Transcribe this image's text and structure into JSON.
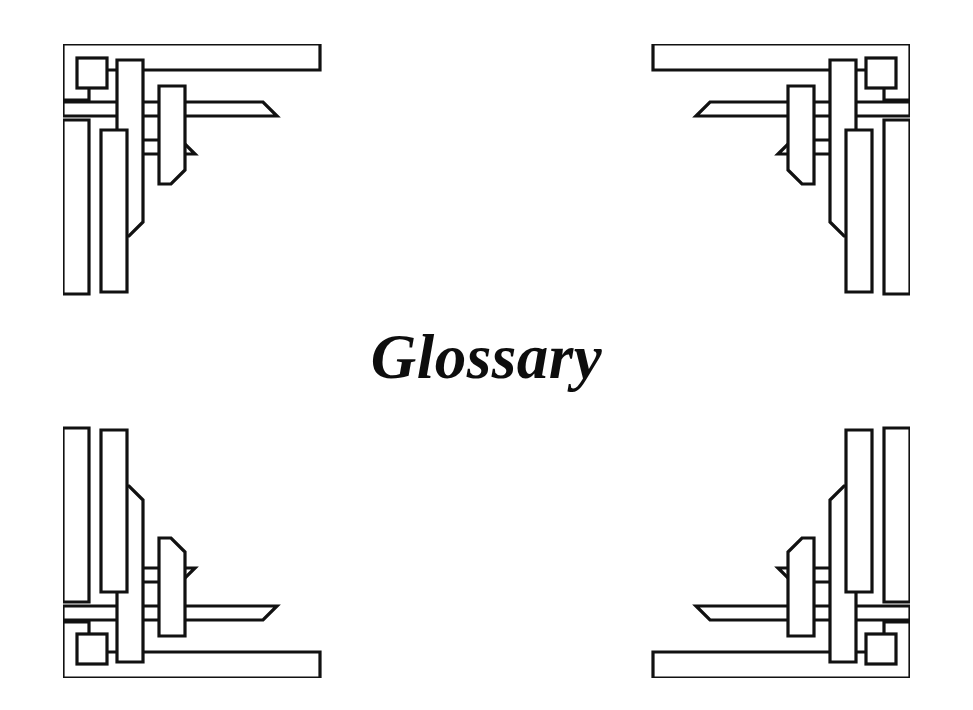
{
  "page": {
    "kind": "book-section-divider",
    "title": "Glossary",
    "background_color": "#ffffff",
    "ink_color": "#111111"
  },
  "ornaments": [
    {
      "name": "corner-ornament-top-left",
      "position": "top-left",
      "style": "celtic-interlace-corner",
      "mirror": "none"
    },
    {
      "name": "corner-ornament-top-right",
      "position": "top-right",
      "style": "celtic-interlace-corner",
      "mirror": "horizontal"
    },
    {
      "name": "corner-ornament-bottom-left",
      "position": "bottom-left",
      "style": "celtic-interlace-corner",
      "mirror": "vertical"
    },
    {
      "name": "corner-ornament-bottom-right",
      "position": "bottom-right",
      "style": "celtic-interlace-corner",
      "mirror": "both"
    }
  ]
}
